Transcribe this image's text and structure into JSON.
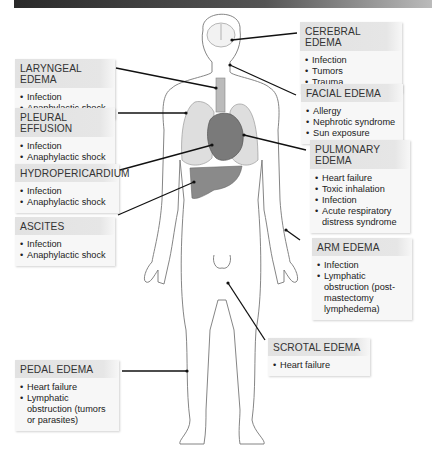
{
  "figure": {
    "labels": [
      {
        "id": "cerebral",
        "title": "CEREBRAL EDEMA",
        "items": [
          "Infection",
          "Tumors",
          "Trauma"
        ]
      },
      {
        "id": "facial",
        "title": "FACIAL EDEMA",
        "items": [
          "Allergy",
          "Nephrotic syndrome",
          "Sun exposure"
        ]
      },
      {
        "id": "pulmonary",
        "title": "PULMONARY EDEMA",
        "items": [
          "Heart failure",
          "Toxic inhalation",
          "Infection",
          "Acute respiratory distress syndrome"
        ]
      },
      {
        "id": "arm",
        "title": "ARM EDEMA",
        "items": [
          "Infection",
          "Lymphatic obstruction (post-mastectomy lymphedema)"
        ]
      },
      {
        "id": "scrotal",
        "title": "SCROTAL EDEMA",
        "items": [
          "Heart failure"
        ]
      },
      {
        "id": "laryngeal",
        "title": "LARYNGEAL EDEMA",
        "items": [
          "Infection",
          "Anaphylactic shock"
        ]
      },
      {
        "id": "pleural",
        "title": "PLEURAL EFFUSION",
        "items": [
          "Infection",
          "Anaphylactic shock"
        ]
      },
      {
        "id": "hydropericardium",
        "title": "HYDROPERICARDIUM",
        "items": [
          "Infection",
          "Anaphylactic shock"
        ]
      },
      {
        "id": "ascites",
        "title": "ASCITES",
        "items": [
          "Infection",
          "Anaphylactic shock"
        ]
      },
      {
        "id": "pedal",
        "title": "PEDAL EDEMA",
        "items": [
          "Heart failure",
          "Lymphatic obstruction (tumors or parasites)"
        ]
      }
    ]
  },
  "colors": {
    "box_bg": "#f7f7f7",
    "header_bg": "#e2e2e2",
    "organ": "#8a8a8a",
    "line": "#111111"
  }
}
